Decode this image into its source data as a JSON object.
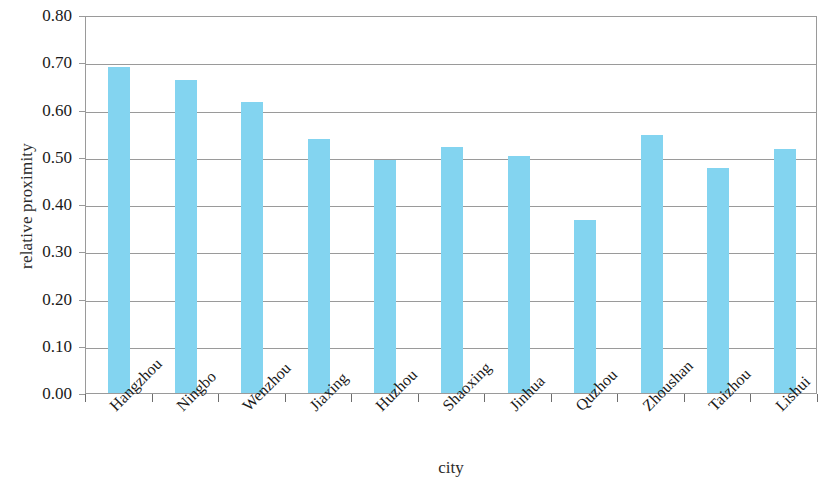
{
  "chart_data": {
    "type": "bar",
    "title": "",
    "xlabel": "city",
    "ylabel": "relative proximity",
    "categories": [
      "Hangzhou",
      "Ningbo",
      "Wenzhou",
      "Jiaxing",
      "Huzhou",
      "Shaoxing",
      "Jinhua",
      "Quzhou",
      "Zhoushan",
      "Taizhou",
      "Lishui"
    ],
    "values": [
      0.69,
      0.662,
      0.615,
      0.537,
      0.494,
      0.521,
      0.501,
      0.366,
      0.547,
      0.477,
      0.516
    ],
    "ylim": [
      0.0,
      0.8
    ],
    "ytick_labels": [
      "0.80",
      "0.70",
      "0.60",
      "0.50",
      "0.40",
      "0.30",
      "0.20",
      "0.10",
      "0.00"
    ],
    "ytick_values": [
      0.8,
      0.7,
      0.6,
      0.5,
      0.4,
      0.3,
      0.2,
      0.1,
      0.0
    ],
    "grid": true,
    "legend": "none",
    "bar_color": "#83d4f0",
    "axis_color": "#9a9a9a"
  }
}
